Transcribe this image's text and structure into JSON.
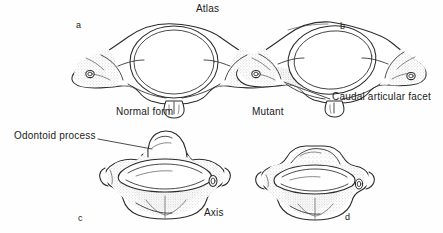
{
  "figure": {
    "background_color": "#fefefe",
    "ink_color": "#2b2b2b",
    "stipple_color": "#9a9a9a",
    "width": 443,
    "height": 233
  },
  "titles": {
    "top": "Atlas",
    "bottom": "Axis"
  },
  "annotations": [
    {
      "id": "caudal-articular-facet",
      "text": "Caudal articular facet",
      "x": 332,
      "y": 97,
      "leader": {
        "x1": 330,
        "y1": 99,
        "x2": 284,
        "y2": 82
      }
    },
    {
      "id": "odontoid-process",
      "text": "Odontoid process",
      "x": 14,
      "y": 135,
      "leader": {
        "x1": 98,
        "y1": 139,
        "x2": 152,
        "y2": 149
      }
    }
  ],
  "panels": [
    {
      "letter": "a",
      "letter_x": 76,
      "letter_y": 22,
      "caption": "Normal form",
      "caption_x": 116,
      "caption_y": 112,
      "specimen": "atlas",
      "variant": "normal"
    },
    {
      "letter": "b",
      "letter_x": 340,
      "letter_y": 23,
      "caption": "Mutant",
      "caption_x": 252,
      "caption_y": 112,
      "specimen": "atlas",
      "variant": "mutant"
    },
    {
      "letter": "c",
      "letter_x": 78,
      "letter_y": 215,
      "caption": "",
      "caption_x": 0,
      "caption_y": 0,
      "specimen": "axis",
      "variant": "normal"
    },
    {
      "letter": "d",
      "letter_x": 345,
      "letter_y": 214,
      "caption": "",
      "caption_x": 0,
      "caption_y": 0,
      "specimen": "axis",
      "variant": "mutant"
    }
  ],
  "title_positions": {
    "top_x": 196,
    "top_y": 9,
    "bottom_x": 204,
    "bottom_y": 213
  }
}
